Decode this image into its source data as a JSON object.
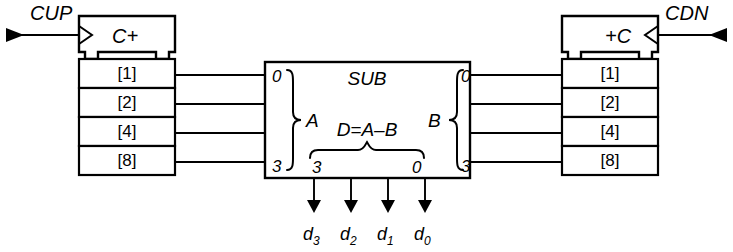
{
  "diagram": {
    "background_color": "#ffffff",
    "line_color": "#000000"
  },
  "left_counter": {
    "name": "left-counter",
    "header_label": "C+",
    "clock_signal": "CUP",
    "cells": [
      {
        "label": "[1]"
      },
      {
        "label": "[2]"
      },
      {
        "label": "[4]"
      },
      {
        "label": "[8]"
      }
    ]
  },
  "right_counter": {
    "name": "right-counter",
    "header_label": "+C",
    "clock_signal": "CDN",
    "cells": [
      {
        "label": "[1]"
      },
      {
        "label": "[2]"
      },
      {
        "label": "[4]"
      },
      {
        "label": "[8]"
      }
    ]
  },
  "sub_block": {
    "title": "SUB",
    "equation": "D=A–B",
    "input_a": {
      "group_label": "A",
      "top_index": "0",
      "bottom_index": "3"
    },
    "input_b": {
      "group_label": "B",
      "top_index": "0",
      "bottom_index": "3"
    },
    "output_d": {
      "left_index": "3",
      "right_index": "0"
    }
  },
  "outputs": [
    {
      "base": "d",
      "subscript": "3"
    },
    {
      "base": "d",
      "subscript": "2"
    },
    {
      "base": "d",
      "subscript": "1"
    },
    {
      "base": "d",
      "subscript": "0"
    }
  ]
}
